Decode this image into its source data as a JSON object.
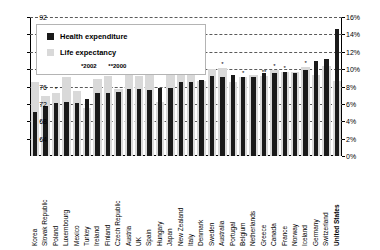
{
  "chart_data": {
    "type": "bar",
    "title": "",
    "subtitle": "",
    "xlabel": "",
    "ylabel": "",
    "grid": true,
    "legend_position": "top-left",
    "axes": {
      "left": {
        "label": "Life expectancy (years)",
        "min": 60,
        "max": 92,
        "ticks": [
          64,
          68,
          72,
          76,
          80,
          84,
          88,
          92
        ],
        "tick_labels": [
          "64",
          "68",
          "72",
          "76",
          "80",
          "84",
          "88",
          "92"
        ]
      },
      "right": {
        "label": "Health expenditure (% of GDP)",
        "min": 0,
        "max": 16,
        "ticks": [
          0,
          2,
          4,
          6,
          8,
          10,
          12,
          14,
          16
        ],
        "tick_labels": [
          "0%",
          "2%",
          "4%",
          "6%",
          "8%",
          "10%",
          "12%",
          "14%",
          "16%"
        ]
      }
    },
    "legend": {
      "entries": [
        {
          "name": "Health expenditure",
          "color": "#1a1a1a",
          "axis": "right"
        },
        {
          "name": "Life expectancy",
          "color": "#d9d9d9",
          "axis": "left"
        }
      ],
      "footnote_1": "*2002",
      "footnote_2": "**2000"
    },
    "categories": [
      "Korea",
      "Slovak Republic",
      "Poland",
      "Luxembourg",
      "Mexico",
      "Turkey",
      "Ireland",
      "Finland",
      "Czech Republic",
      "Austria",
      "UK",
      "Spain",
      "Hungary",
      "Japan",
      "New Zealand",
      "Italy",
      "Denmark",
      "Sweden",
      "Australia",
      "Portugal",
      "Belgium",
      "Netherlands",
      "Greece",
      "Canada",
      "France",
      "Norway",
      "Iceland",
      "Germany",
      "Switzerland",
      "United States"
    ],
    "highlight_category": "United States",
    "series": [
      {
        "name": "Life expectancy",
        "axis": "left",
        "unit": "years",
        "color": "#d9d9d9",
        "values": [
          77.0,
          73.8,
          74.6,
          78.3,
          74.9,
          71.0,
          77.8,
          78.5,
          75.4,
          79.0,
          78.5,
          79.8,
          72.4,
          81.8,
          78.9,
          80.0,
          77.2,
          80.0,
          80.3,
          77.0,
          78.2,
          78.6,
          78.4,
          79.7,
          79.4,
          79.4,
          80.6,
          78.6,
          80.7,
          77.3
        ],
        "footnote_marks": [
          "",
          "",
          "*",
          "*",
          "",
          "*",
          "*",
          "",
          "",
          "*",
          "",
          "*",
          "",
          "",
          "",
          "*",
          "",
          "",
          "*",
          "",
          "*",
          "",
          "**",
          "*",
          "*",
          "",
          "*",
          "",
          "*",
          "*"
        ]
      },
      {
        "name": "Health expenditure",
        "axis": "right",
        "unit": "% of GDP",
        "color": "#1a1a1a",
        "values": [
          5.1,
          5.7,
          6.1,
          6.2,
          6.1,
          6.6,
          7.3,
          7.3,
          7.4,
          7.7,
          7.7,
          7.6,
          7.8,
          7.8,
          8.5,
          8.5,
          8.8,
          9.2,
          9.1,
          9.3,
          9.1,
          9.1,
          9.5,
          9.6,
          9.7,
          9.6,
          9.9,
          10.9,
          11.2,
          14.6
        ]
      }
    ]
  }
}
